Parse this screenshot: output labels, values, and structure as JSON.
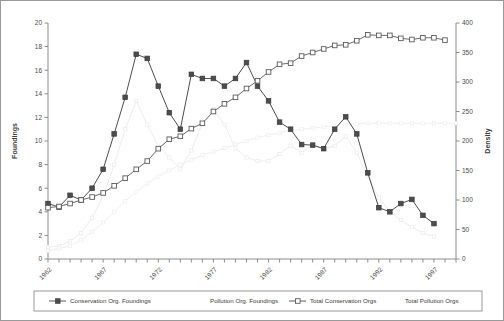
{
  "chart_data": {
    "type": "line",
    "title": "",
    "xlabel": "",
    "ylabel": "Foundings",
    "y2label": "Density",
    "ylim": [
      0,
      20
    ],
    "y2lim": [
      0,
      400
    ],
    "ytick_labels": [
      "0",
      "2",
      "4",
      "6",
      "8",
      "10",
      "12",
      "14",
      "16",
      "18",
      "20"
    ],
    "y2tick_labels": [
      "0",
      "50",
      "100",
      "150",
      "200",
      "250",
      "300",
      "350",
      "400"
    ],
    "xlim": [
      1962,
      1999
    ],
    "x": [
      1962,
      1963,
      1964,
      1965,
      1966,
      1967,
      1968,
      1969,
      1970,
      1971,
      1972,
      1973,
      1974,
      1975,
      1976,
      1977,
      1978,
      1979,
      1980,
      1981,
      1982,
      1983,
      1984,
      1985,
      1986,
      1987,
      1988,
      1989,
      1990,
      1991,
      1992,
      1993,
      1994,
      1995,
      1996,
      1997,
      1998,
      1999
    ],
    "xtick_labels": [
      "1962",
      "1967",
      "1972",
      "1977",
      "1982",
      "1987",
      "1992",
      "1997"
    ],
    "xticks_labeled": [
      1962,
      1967,
      1972,
      1977,
      1982,
      1987,
      1992,
      1997
    ],
    "grid": false,
    "legend_position": "bottom",
    "series": [
      {
        "name": "Conservation Org. Foundings",
        "axis": "left",
        "marker": "filled-square",
        "color": "#4d4d4d",
        "prominent": true,
        "values": [
          4.7,
          4.4,
          5.4,
          5.0,
          6.0,
          7.6,
          10.6,
          13.7,
          17.35,
          17.0,
          14.65,
          12.4,
          11.0,
          15.65,
          15.3,
          15.3,
          14.65,
          15.3,
          16.65,
          14.65,
          13.4,
          11.6,
          11.0,
          9.7,
          9.65,
          9.35,
          11.0,
          12.05,
          10.6,
          7.3,
          4.35,
          4.0,
          4.7,
          5.05,
          3.7,
          3.0,
          null,
          null
        ]
      },
      {
        "name": "Pollution Org. Foundings",
        "axis": "left",
        "marker": "faint-line",
        "color": "#ededed",
        "prominent": false,
        "values": [
          1.0,
          1.1,
          1.5,
          2.2,
          3.5,
          5.3,
          8.0,
          11.0,
          13.4,
          11.4,
          9.6,
          8.6,
          7.6,
          9.2,
          11.5,
          12.7,
          11.4,
          9.4,
          8.6,
          8.3,
          8.3,
          8.9,
          9.6,
          9.0,
          9.7,
          9.3,
          9.6,
          10.4,
          9.0,
          7.0,
          5.2,
          4.0,
          3.3,
          2.7,
          2.2,
          1.9,
          null,
          null
        ]
      },
      {
        "name": "Total Conservation Orgs",
        "axis": "right",
        "marker": "open-square",
        "color": "#6a6a6a",
        "prominent": true,
        "values": [
          4.35,
          4.45,
          4.7,
          5.0,
          5.25,
          5.6,
          6.2,
          6.85,
          7.6,
          8.3,
          9.35,
          10.15,
          10.4,
          11.05,
          11.5,
          12.5,
          13.15,
          13.7,
          14.45,
          15.1,
          15.85,
          16.5,
          16.6,
          17.2,
          17.5,
          17.8,
          18.1,
          18.15,
          18.5,
          19.0,
          18.95,
          18.95,
          18.7,
          18.6,
          18.75,
          18.75,
          18.55,
          null
        ]
      },
      {
        "name": "Total Pollution Orgs",
        "axis": "right",
        "marker": "faint-line",
        "color": "#f0f0f0",
        "prominent": false,
        "values": [
          0.7,
          0.9,
          1.1,
          1.6,
          2.3,
          3.1,
          4.0,
          4.9,
          5.7,
          6.4,
          7.0,
          7.5,
          8.0,
          8.4,
          8.8,
          9.1,
          9.4,
          9.7,
          10.0,
          10.3,
          10.5,
          10.7,
          10.9,
          11.0,
          11.1,
          11.2,
          11.3,
          11.4,
          11.45,
          11.5,
          11.5,
          11.5,
          11.5,
          11.5,
          11.5,
          11.5,
          11.5,
          11.5
        ]
      }
    ]
  },
  "axes": {
    "left_title": "Foundings",
    "right_title": "Density"
  },
  "legend": {
    "items": [
      {
        "label": "Conservation Org. Foundings",
        "marker": "filled-square",
        "show_marker": true
      },
      {
        "label": "Pollution Org. Foundings",
        "marker": "faint",
        "show_marker": false
      },
      {
        "label": "Total Conservation Orgs",
        "marker": "open-square",
        "show_marker": true
      },
      {
        "label": "Total Pollution Orgs",
        "marker": "faint",
        "show_marker": false
      }
    ]
  }
}
